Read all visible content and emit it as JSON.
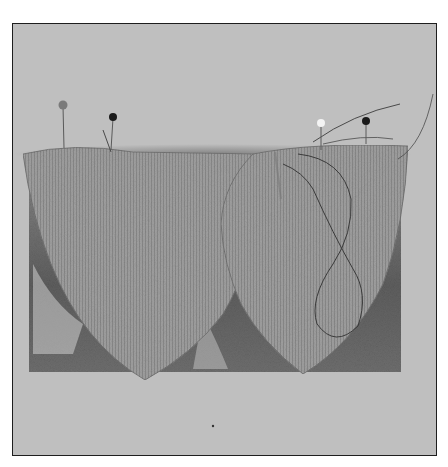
{
  "image": {
    "description": "Black and white photograph of two pointed knit-fabric pattern pieces pinned along the top edge over a fur-lined backing, with a loose thread loop on the right piece",
    "alt": "Two knit fabric pieces pinned on fur backing",
    "colors": {
      "background_outer": "#ffffff",
      "backdrop": "#bdbdbd",
      "frame_border": "#1e1e1e",
      "fabric": "#9a9a9a",
      "fur_dark": "#5a5a5a",
      "pin_heads": [
        "#7a7a7a",
        "#1a1a1a",
        "#f4f4f4",
        "#1a1a1a"
      ]
    },
    "objects": [
      "frame",
      "fur-backing",
      "fabric-piece-left",
      "fabric-piece-right",
      "pins",
      "thread-loop"
    ]
  }
}
